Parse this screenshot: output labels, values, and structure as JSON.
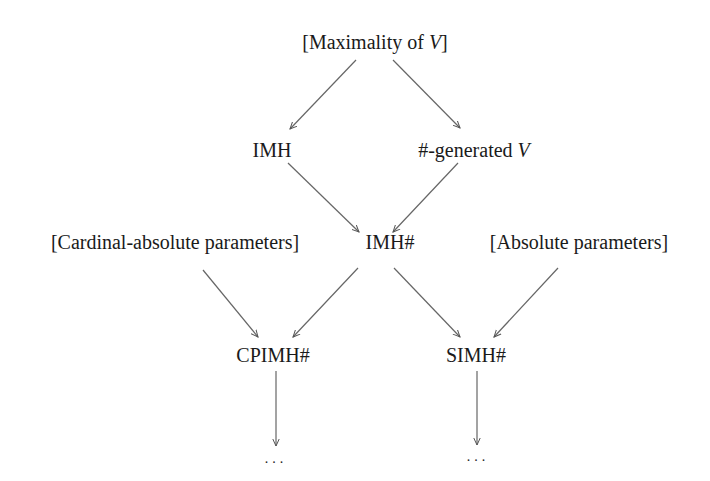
{
  "diagram": {
    "nodes": [
      {
        "id": "maximality",
        "label_prefix": "[Maximality of ",
        "label_var": "V",
        "label_suffix": "]",
        "x": 375,
        "y": 42
      },
      {
        "id": "imh",
        "label": "IMH",
        "x": 272,
        "y": 150
      },
      {
        "id": "sharp_generated",
        "label_prefix": "#-generated ",
        "label_var": "V",
        "x": 474,
        "y": 150
      },
      {
        "id": "cardinal_absolute",
        "label": "[Cardinal-absolute parameters]",
        "x": 175,
        "y": 242
      },
      {
        "id": "imh_sharp",
        "label": "IMH#",
        "x": 390,
        "y": 242
      },
      {
        "id": "absolute",
        "label": "[Absolute parameters]",
        "x": 579,
        "y": 242
      },
      {
        "id": "cpimh_sharp",
        "label": "CPIMH#",
        "x": 273,
        "y": 355
      },
      {
        "id": "simh_sharp",
        "label": "SIMH#",
        "x": 476,
        "y": 355
      },
      {
        "id": "dots_left",
        "label": "...",
        "x": 274,
        "y": 459
      },
      {
        "id": "dots_right",
        "label": "...",
        "x": 476,
        "y": 457
      }
    ],
    "edges": [
      {
        "from": "maximality",
        "to": "imh"
      },
      {
        "from": "maximality",
        "to": "sharp_generated"
      },
      {
        "from": "imh",
        "to": "imh_sharp"
      },
      {
        "from": "sharp_generated",
        "to": "imh_sharp"
      },
      {
        "from": "cardinal_absolute",
        "to": "cpimh_sharp"
      },
      {
        "from": "imh_sharp",
        "to": "cpimh_sharp"
      },
      {
        "from": "imh_sharp",
        "to": "simh_sharp"
      },
      {
        "from": "absolute",
        "to": "simh_sharp"
      },
      {
        "from": "cpimh_sharp",
        "to": "dots_left"
      },
      {
        "from": "simh_sharp",
        "to": "dots_right"
      }
    ]
  }
}
